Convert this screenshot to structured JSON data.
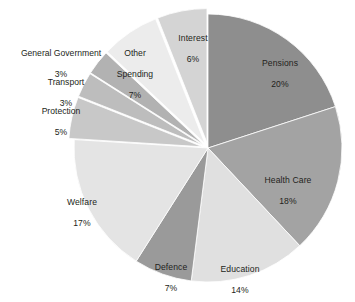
{
  "chart_data": {
    "type": "pie",
    "title": "",
    "subtitle": "",
    "xlabel": "",
    "ylabel": "",
    "legend_position": "none",
    "grid": false,
    "value_unit": "percent",
    "labels": [
      "Pensions",
      "Health Care",
      "Education",
      "Defence",
      "Welfare",
      "Protection",
      "Transport",
      "General Government",
      "Other Spending",
      "Interest"
    ],
    "values": [
      20,
      18,
      14,
      7,
      17,
      5,
      3,
      3,
      7,
      6
    ],
    "value_labels": [
      "20%",
      "18%",
      "14%",
      "7%",
      "17%",
      "5%",
      "3%",
      "3%",
      "7%",
      "6%"
    ],
    "colors": [
      "#8e8e8e",
      "#a3a3a3",
      "#e0e0e0",
      "#9a9a9a",
      "#e4e4e4",
      "#c8c8c8",
      "#bdbdbd",
      "#b2b2b2",
      "#ececec",
      "#d4d4d4"
    ],
    "start_angle_deg": 0,
    "direction": "clockwise",
    "slices": [
      {
        "name": "Pensions",
        "value": 20,
        "value_label": "20%",
        "color": "#8e8e8e",
        "label_placement": "inside",
        "exploded": false
      },
      {
        "name": "Health Care",
        "value": 18,
        "value_label": "18%",
        "color": "#a3a3a3",
        "label_placement": "inside",
        "exploded": false
      },
      {
        "name": "Education",
        "value": 14,
        "value_label": "14%",
        "color": "#e0e0e0",
        "label_placement": "inside",
        "exploded": false
      },
      {
        "name": "Defence",
        "value": 7,
        "value_label": "7%",
        "color": "#9a9a9a",
        "label_placement": "inside",
        "exploded": false
      },
      {
        "name": "Welfare",
        "value": 17,
        "value_label": "17%",
        "color": "#e4e4e4",
        "label_placement": "inside",
        "exploded": false
      },
      {
        "name": "Protection",
        "value": 5,
        "value_label": "5%",
        "color": "#c8c8c8",
        "label_placement": "outside",
        "exploded": true
      },
      {
        "name": "Transport",
        "value": 3,
        "value_label": "3%",
        "color": "#bdbdbd",
        "label_placement": "outside",
        "exploded": true
      },
      {
        "name": "General Government",
        "value": 3,
        "value_label": "3%",
        "color": "#b2b2b2",
        "label_placement": "outside",
        "exploded": true
      },
      {
        "name": "Other Spending",
        "value": 7,
        "value_label": "7%",
        "color": "#ececec",
        "label_placement": "outside",
        "exploded": true
      },
      {
        "name": "Interest",
        "value": 6,
        "value_label": "6%",
        "color": "#d4d4d4",
        "label_placement": "inside",
        "exploded": true
      }
    ]
  },
  "labels": {
    "pensions": {
      "name": "Pensions",
      "value": "20%"
    },
    "health_care": {
      "name": "Health Care",
      "value": "18%"
    },
    "education": {
      "name": "Education",
      "value": "14%"
    },
    "defence": {
      "name": "Defence",
      "value": "7%"
    },
    "welfare": {
      "name": "Welfare",
      "value": "17%"
    },
    "protection": {
      "name": "Protection",
      "value": "5%"
    },
    "transport": {
      "name": "Transport",
      "value": "3%"
    },
    "general_government": {
      "name": "General Government",
      "value": "3%"
    },
    "other_spending": {
      "name": "Other",
      "name2": "Spending",
      "value": "7%"
    },
    "interest": {
      "name": "Interest",
      "value": "6%"
    }
  }
}
